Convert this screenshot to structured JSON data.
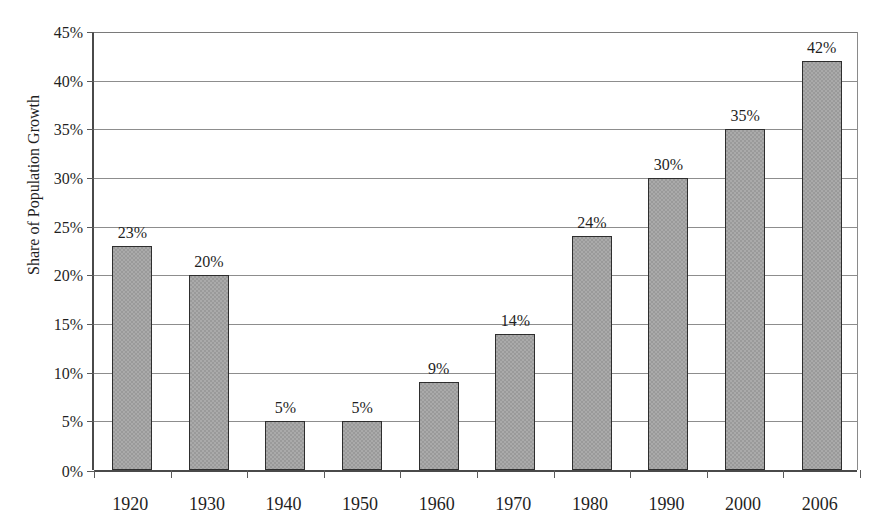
{
  "figure": {
    "title_remnant": "",
    "background_color": "#ffffff"
  },
  "chart_data": {
    "type": "bar",
    "title": "",
    "xlabel": "",
    "ylabel": "Share of Population Growth",
    "categories": [
      "1920",
      "1930",
      "1940",
      "1950",
      "1960",
      "1970",
      "1980",
      "1990",
      "2000",
      "2006"
    ],
    "values": [
      23,
      20,
      5,
      5,
      9,
      14,
      24,
      30,
      35,
      42
    ],
    "data_labels": [
      "23%",
      "20%",
      "5%",
      "5%",
      "9%",
      "14%",
      "24%",
      "30%",
      "35%",
      "42%"
    ],
    "ylim": [
      0,
      45
    ],
    "ytick_values": [
      0,
      5,
      10,
      15,
      20,
      25,
      30,
      35,
      40,
      45
    ],
    "ytick_labels": [
      "0%",
      "5%",
      "10%",
      "15%",
      "20%",
      "25%",
      "30%",
      "35%",
      "40%",
      "45%"
    ],
    "grid": "horizontal",
    "legend": "none",
    "bar_color": "#9a9a9a",
    "bar_border_color": "#2e2e2e",
    "gridline_color": "#8d8d8d",
    "axis_color": "#4a4a4a"
  }
}
